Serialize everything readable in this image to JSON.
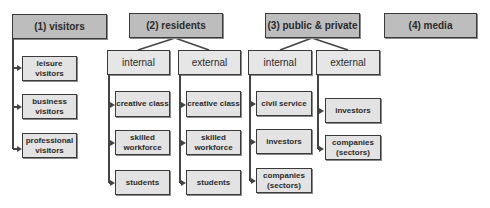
{
  "diagram": {
    "categories": [
      {
        "label": "(1) visitors",
        "children": [
          "leisure visitors",
          "business visitors",
          "professional visitors"
        ]
      },
      {
        "label": "(2) residents",
        "groups": [
          {
            "label": "internal",
            "children": [
              "creative class",
              "skilled workforce",
              "students"
            ]
          },
          {
            "label": "external",
            "children": [
              "creative class",
              "skilled workforce",
              "students"
            ]
          }
        ]
      },
      {
        "label": "(3) public & private",
        "groups": [
          {
            "label": "internal",
            "children": [
              "civil service",
              "investors",
              "companies (sectors)"
            ]
          },
          {
            "label": "external",
            "children": [
              "investors",
              "companies (sectors)"
            ]
          }
        ]
      },
      {
        "label": "(4) media"
      }
    ]
  },
  "colors": {
    "top_box_fill": "#bdbdbd",
    "sub_box_fill": "#e6e6e6",
    "leaf_box_fill": "#e3e3e3",
    "border": "#3a3a3a"
  }
}
